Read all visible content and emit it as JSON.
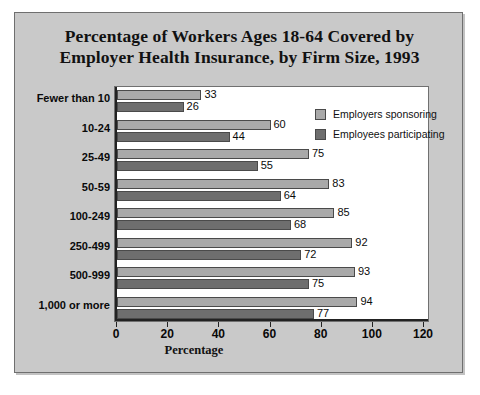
{
  "chart_data": {
    "type": "bar",
    "orientation": "horizontal",
    "title": "Percentage of Workers Ages 18-64 Covered by Employer Health Insurance, by Firm Size, 1993",
    "title_lines": [
      "Percentage of Workers Ages 18-64 Covered by",
      "Employer Health Insurance, by Firm Size, 1993"
    ],
    "xlabel": "Percentage",
    "ylabel": "",
    "categories": [
      "Fewer than 10",
      "10-24",
      "25-49",
      "50-59",
      "100-249",
      "250-499",
      "500-999",
      "1,000 or more"
    ],
    "series": [
      {
        "name": "Employers sponsoring",
        "color": "#a9a9a9",
        "values": [
          33,
          60,
          75,
          83,
          85,
          92,
          93,
          94
        ]
      },
      {
        "name": "Employees participating",
        "color": "#6e6e6e",
        "values": [
          26,
          44,
          55,
          64,
          68,
          72,
          75,
          77
        ]
      }
    ],
    "xlim": [
      0,
      120
    ],
    "xticks": [
      0,
      20,
      40,
      60,
      80,
      100,
      120
    ],
    "xtick_labels": [
      "0",
      "20",
      "40",
      "60",
      "80",
      "100",
      "120"
    ],
    "grid": false,
    "legend_position": "top-right-inside",
    "data_labels": true
  },
  "legend": {
    "items": [
      {
        "label": "Employers sponsoring",
        "color": "#a9a9a9"
      },
      {
        "label": "Employees participating",
        "color": "#6e6e6e"
      }
    ]
  },
  "colors": {
    "plate_background": "#c9c9c9",
    "plot_background": "#ffffff",
    "frame": "#707070",
    "axis": "#222222",
    "sponsor_bar": "#a9a9a9",
    "participate_bar": "#6e6e6e",
    "text": "#0a0a0a"
  }
}
